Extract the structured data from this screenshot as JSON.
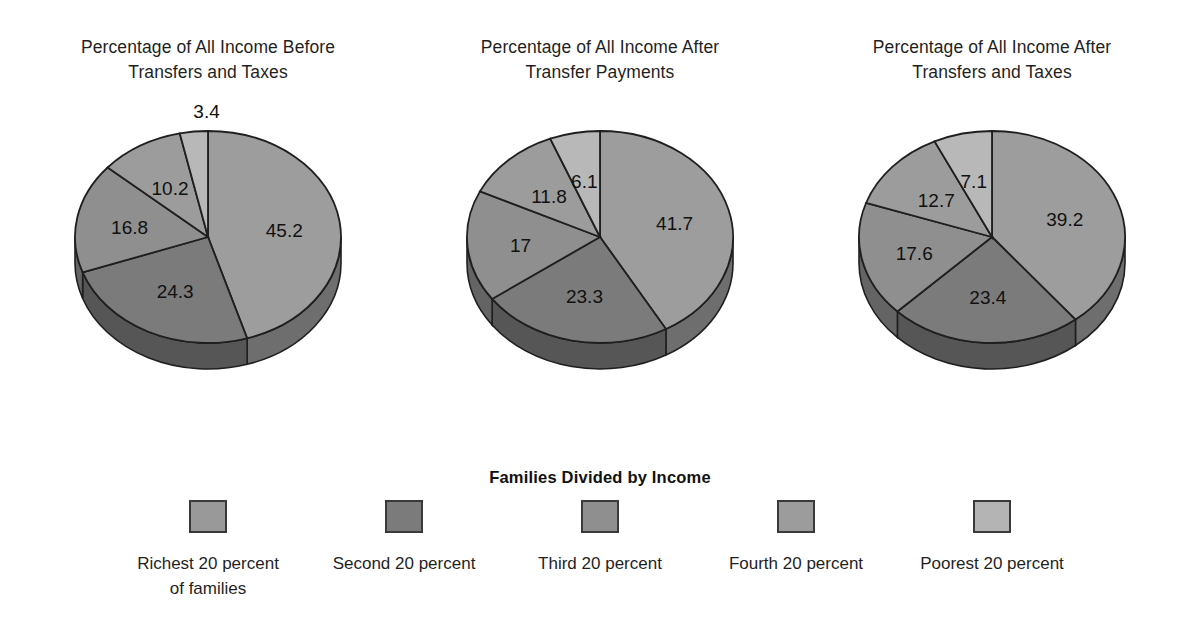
{
  "chart_data": [
    {
      "type": "pie",
      "title": "Percentage of All Income Before\nTransfers and Taxes",
      "categories": [
        "Richest 20 percent of families",
        "Second 20 percent",
        "Third 20 percent",
        "Fourth 20 percent",
        "Poorest 20 percent"
      ],
      "values": [
        45.2,
        24.3,
        16.8,
        10.2,
        3.4
      ],
      "labels": [
        "45.2",
        "24.3",
        "16.8",
        "10.2",
        "3.4"
      ],
      "xlabel": "",
      "ylabel": "",
      "legend_position": "bottom",
      "grid": false
    },
    {
      "type": "pie",
      "title": "Percentage of All Income After\nTransfer Payments",
      "categories": [
        "Richest 20 percent of families",
        "Second 20 percent",
        "Third 20 percent",
        "Fourth 20 percent",
        "Poorest 20 percent"
      ],
      "values": [
        41.7,
        23.3,
        17,
        11.8,
        6.1
      ],
      "labels": [
        "41.7",
        "23.3",
        "17",
        "11.8",
        "6.1"
      ],
      "xlabel": "",
      "ylabel": "",
      "legend_position": "bottom",
      "grid": false
    },
    {
      "type": "pie",
      "title": "Percentage of All Income After\nTransfers and Taxes",
      "categories": [
        "Richest 20 percent of families",
        "Second 20 percent",
        "Third 20 percent",
        "Fourth 20 percent",
        "Poorest 20 percent"
      ],
      "values": [
        39.2,
        23.4,
        17.6,
        12.7,
        7.1
      ],
      "labels": [
        "39.2",
        "23.4",
        "17.6",
        "12.7",
        "7.1"
      ],
      "xlabel": "",
      "ylabel": "",
      "legend_position": "bottom",
      "grid": false
    }
  ],
  "charts": [
    {
      "title": "Percentage of All Income Before\nTransfers and Taxes"
    },
    {
      "title": "Percentage of All Income After\nTransfer Payments"
    },
    {
      "title": "Percentage of All Income After\nTransfers and Taxes"
    }
  ],
  "legend": {
    "heading": "Families Divided by Income",
    "items": [
      {
        "label": "Richest 20 percent\nof families",
        "color": "#999999"
      },
      {
        "label": "Second 20 percent",
        "color": "#7b7b7b"
      },
      {
        "label": "Third 20 percent",
        "color": "#8f8f8f"
      },
      {
        "label": "Fourth 20 percent",
        "color": "#9c9c9c"
      },
      {
        "label": "Poorest 20 percent",
        "color": "#b4b4b4"
      }
    ]
  },
  "colors": {
    "slice_richest": "#9d9d9d",
    "slice_second": "#7b7b7b",
    "slice_third": "#8f8f8f",
    "slice_fourth": "#9c9c9c",
    "slice_poorest": "#b8b8b8",
    "outline": "#1f1f1f",
    "background": "#ffffff"
  }
}
